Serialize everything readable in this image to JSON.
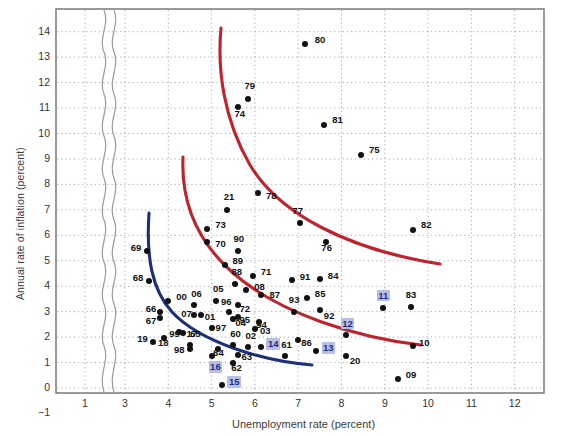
{
  "chart_data": {
    "type": "scatter",
    "title": "",
    "xlabel": "Unemployment rate (percent)",
    "ylabel": "Annual rate of inflation (percent)",
    "xlim": [
      0.5,
      12.7
    ],
    "ylim": [
      -1,
      14.6
    ],
    "xticks": [
      1,
      3,
      4,
      5,
      6,
      7,
      8,
      9,
      10,
      11,
      12
    ],
    "yticks": [
      -1,
      0,
      1,
      2,
      3,
      4,
      5,
      6,
      7,
      8,
      9,
      10,
      11,
      12,
      13,
      14
    ],
    "grid": true,
    "axis_break": {
      "present": true,
      "between": [
        1,
        3
      ],
      "style": "wavy"
    },
    "legend": "none",
    "point_color": "#111111",
    "highlight_text_color": "#1b2f8a",
    "highlight_bg_color": "#b9bfe4",
    "curve_colors": {
      "red": "#c0232b",
      "blue": "#1c2f7a"
    },
    "points": [
      {
        "label": "80",
        "x": 7.15,
        "y": 13.5,
        "lx": 10,
        "ly": -5,
        "hl": false
      },
      {
        "label": "79",
        "x": 5.85,
        "y": 11.35,
        "lx": -4,
        "ly": -14,
        "hl": false
      },
      {
        "label": "74",
        "x": 5.62,
        "y": 11.05,
        "lx": -4,
        "ly": 6,
        "hl": false
      },
      {
        "label": "81",
        "x": 7.6,
        "y": 10.35,
        "lx": 8,
        "ly": -6,
        "hl": false
      },
      {
        "label": "75",
        "x": 8.45,
        "y": 9.15,
        "lx": 8,
        "ly": -6,
        "hl": false
      },
      {
        "label": "21",
        "x": 5.35,
        "y": 7.0,
        "lx": -3,
        "ly": -14,
        "hl": false
      },
      {
        "label": "78",
        "x": 6.07,
        "y": 7.65,
        "lx": 8,
        "ly": 2,
        "hl": false
      },
      {
        "label": "77",
        "x": 7.05,
        "y": 6.5,
        "lx": -8,
        "ly": -13,
        "hl": false
      },
      {
        "label": "82",
        "x": 9.65,
        "y": 6.2,
        "lx": 8,
        "ly": -6,
        "hl": false
      },
      {
        "label": "73",
        "x": 4.9,
        "y": 6.25,
        "lx": 8,
        "ly": -5,
        "hl": false
      },
      {
        "label": "70",
        "x": 4.9,
        "y": 5.75,
        "lx": 8,
        "ly": 1,
        "hl": false
      },
      {
        "label": "90",
        "x": 5.6,
        "y": 5.4,
        "lx": -4,
        "ly": -13,
        "hl": false
      },
      {
        "label": "76",
        "x": 7.65,
        "y": 5.75,
        "lx": -5,
        "ly": 5,
        "hl": false
      },
      {
        "label": "89",
        "x": 5.3,
        "y": 4.85,
        "lx": 8,
        "ly": -5,
        "hl": false
      },
      {
        "label": "88",
        "x": 5.55,
        "y": 4.1,
        "lx": -4,
        "ly": -13,
        "hl": false
      },
      {
        "label": "71",
        "x": 5.95,
        "y": 4.4,
        "lx": 8,
        "ly": -5,
        "hl": false
      },
      {
        "label": "08",
        "x": 5.8,
        "y": 3.85,
        "lx": 8,
        "ly": -4,
        "hl": false
      },
      {
        "label": "87",
        "x": 6.15,
        "y": 3.65,
        "lx": 8,
        "ly": -1,
        "hl": false
      },
      {
        "label": "91",
        "x": 6.85,
        "y": 4.25,
        "lx": 8,
        "ly": -4,
        "hl": false
      },
      {
        "label": "84",
        "x": 7.5,
        "y": 4.3,
        "lx": 8,
        "ly": -4,
        "hl": false
      },
      {
        "label": "85",
        "x": 7.2,
        "y": 3.55,
        "lx": 8,
        "ly": -5,
        "hl": false
      },
      {
        "label": "93",
        "x": 6.9,
        "y": 3.0,
        "lx": -5,
        "ly": -13,
        "hl": false
      },
      {
        "label": "92",
        "x": 7.5,
        "y": 3.05,
        "lx": 4,
        "ly": 5,
        "hl": false
      },
      {
        "label": "83",
        "x": 9.6,
        "y": 3.2,
        "lx": -5,
        "ly": -13,
        "hl": false
      },
      {
        "label": "11",
        "x": 8.95,
        "y": 3.15,
        "lx": -6,
        "ly": -14,
        "hl": true
      },
      {
        "label": "00",
        "x": 4.0,
        "y": 3.4,
        "lx": 8,
        "ly": -5,
        "hl": false
      },
      {
        "label": "05",
        "x": 5.1,
        "y": 3.4,
        "lx": -3,
        "ly": -13,
        "hl": false
      },
      {
        "label": "06",
        "x": 4.6,
        "y": 3.25,
        "lx": -3,
        "ly": -12,
        "hl": false
      },
      {
        "label": "96",
        "x": 5.4,
        "y": 3.0,
        "lx": -8,
        "ly": -11,
        "hl": false
      },
      {
        "label": "72",
        "x": 5.6,
        "y": 3.25,
        "lx": 2,
        "ly": 3,
        "hl": false
      },
      {
        "label": "66",
        "x": 3.8,
        "y": 3.0,
        "lx": -14,
        "ly": -4,
        "hl": false
      },
      {
        "label": "67",
        "x": 3.8,
        "y": 2.75,
        "lx": -14,
        "ly": 2,
        "hl": false
      },
      {
        "label": "95",
        "x": 5.6,
        "y": 2.8,
        "lx": 2,
        "ly": 2,
        "hl": false
      },
      {
        "label": "94",
        "x": 6.1,
        "y": 2.6,
        "lx": -3,
        "ly": 2,
        "hl": false
      },
      {
        "label": "07",
        "x": 4.6,
        "y": 2.85,
        "lx": -13,
        "ly": -2,
        "hl": false
      },
      {
        "label": "01",
        "x": 4.75,
        "y": 2.85,
        "lx": 4,
        "ly": 1,
        "hl": false
      },
      {
        "label": "99",
        "x": 4.25,
        "y": 2.2,
        "lx": -10,
        "ly": 1,
        "hl": false
      },
      {
        "label": "17",
        "x": 4.35,
        "y": 2.15,
        "lx": 3,
        "ly": 0,
        "hl": false
      },
      {
        "label": "97",
        "x": 5.0,
        "y": 2.35,
        "lx": 4,
        "ly": -1,
        "hl": false
      },
      {
        "label": "04",
        "x": 5.5,
        "y": 2.7,
        "lx": 2,
        "ly": 3,
        "hl": false
      },
      {
        "label": "03",
        "x": 6.0,
        "y": 2.3,
        "lx": 5,
        "ly": 1,
        "hl": false
      },
      {
        "label": "19",
        "x": 3.65,
        "y": 1.8,
        "lx": -16,
        "ly": -4,
        "hl": false
      },
      {
        "label": "18",
        "x": 3.9,
        "y": 1.95,
        "lx": -6,
        "ly": 4,
        "hl": false
      },
      {
        "label": "65",
        "x": 4.5,
        "y": 1.7,
        "lx": 0,
        "ly": -12,
        "hl": false
      },
      {
        "label": "98",
        "x": 4.5,
        "y": 1.55,
        "lx": -16,
        "ly": 0,
        "hl": false
      },
      {
        "label": "64",
        "x": 5.15,
        "y": 1.55,
        "lx": -5,
        "ly": 3,
        "hl": false
      },
      {
        "label": "60",
        "x": 5.5,
        "y": 1.7,
        "lx": -3,
        "ly": -12,
        "hl": false
      },
      {
        "label": "02",
        "x": 5.85,
        "y": 1.6,
        "lx": -3,
        "ly": -12,
        "hl": false
      },
      {
        "label": "63",
        "x": 5.6,
        "y": 1.3,
        "lx": 4,
        "ly": 1,
        "hl": false
      },
      {
        "label": "62",
        "x": 5.5,
        "y": 1.0,
        "lx": -2,
        "ly": 4,
        "hl": false
      },
      {
        "label": "14",
        "x": 6.15,
        "y": 1.6,
        "lx": 5,
        "ly": -5,
        "hl": true
      },
      {
        "label": "61",
        "x": 6.7,
        "y": 1.25,
        "lx": -4,
        "ly": -12,
        "hl": false
      },
      {
        "label": "86",
        "x": 7.0,
        "y": 1.9,
        "lx": 3,
        "ly": 2,
        "hl": false
      },
      {
        "label": "12",
        "x": 8.1,
        "y": 2.1,
        "lx": -5,
        "ly": -13,
        "hl": true
      },
      {
        "label": "13",
        "x": 7.4,
        "y": 1.45,
        "lx": 6,
        "ly": -5,
        "hl": true
      },
      {
        "label": "20",
        "x": 8.1,
        "y": 1.25,
        "lx": 4,
        "ly": 4,
        "hl": false
      },
      {
        "label": "10",
        "x": 9.65,
        "y": 1.65,
        "lx": 6,
        "ly": -4,
        "hl": false
      },
      {
        "label": "16",
        "x": 5.0,
        "y": 1.25,
        "lx": -3,
        "ly": 9,
        "hl": true
      },
      {
        "label": "15",
        "x": 5.25,
        "y": 0.1,
        "lx": 5,
        "ly": -5,
        "hl": true
      },
      {
        "label": "09",
        "x": 9.3,
        "y": 0.35,
        "lx": 8,
        "ly": -5,
        "hl": false
      },
      {
        "label": "68",
        "x": 3.55,
        "y": 4.2,
        "lx": -16,
        "ly": -4,
        "hl": false
      },
      {
        "label": "69",
        "x": 3.5,
        "y": 5.4,
        "lx": -16,
        "ly": -4,
        "hl": false
      }
    ],
    "curves": [
      {
        "name": "phillips-curve-1970s",
        "color": "#c0232b",
        "path": "M 221,28 C 217,70 224,120 250,165 C 280,215 350,250 440,264"
      },
      {
        "name": "phillips-curve-1980s",
        "color": "#c0232b",
        "path": "M 183,157 C 181,200 196,240 232,272 C 280,315 360,338 421,345"
      },
      {
        "name": "phillips-curve-1960s",
        "color": "#1c2f7a",
        "path": "M 149,213 C 146,258 152,290 172,312 C 200,342 262,361 312,365"
      }
    ]
  },
  "axis": {
    "xtick_labels": [
      "1",
      "3",
      "4",
      "5",
      "6",
      "7",
      "8",
      "9",
      "10",
      "11",
      "12"
    ],
    "ytick_labels": [
      "14",
      "13",
      "12",
      "11",
      "10",
      "9",
      "8",
      "7",
      "6",
      "5",
      "4",
      "3",
      "2",
      "1",
      "0",
      "−1"
    ],
    "x_title": "Unemployment rate (percent)",
    "y_title": "Annual rate of inflation (percent)"
  }
}
